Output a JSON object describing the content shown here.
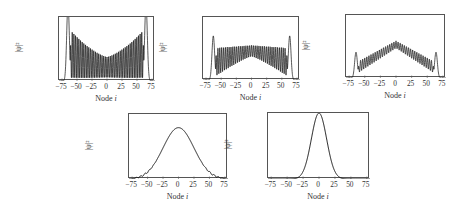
{
  "chart_data": [
    {
      "type": "line",
      "title": "",
      "xlabel": "Node i",
      "ylabel": "|ψ|²",
      "xlim": [
        -80,
        80
      ],
      "ylim": [
        0,
        0.02
      ],
      "x_ticks": [
        "−75",
        "−50",
        "−25",
        "0",
        "25",
        "50",
        "75"
      ],
      "y_ticks": [
        "0.02",
        "0.0175",
        "0.015",
        "0.0125",
        "0.01",
        "0.0075",
        "0.005",
        "0.0025"
      ],
      "grid": false,
      "frame": {
        "left": 58,
        "top": 16,
        "width": 96,
        "height": 64
      },
      "description": "Dense oscillations between ~0.001 and an envelope rising from ~0.0075 at center to ~0.015 near |i|=55; sharp edge peaks exceeding 0.02 at i≈±65; drops to 0 beyond |i|≈70",
      "series": [
        {
          "name": "|psi|^2",
          "profile": "edge-peaked",
          "center_env": 0.0075,
          "edge_env": 0.0155,
          "low": 0.001,
          "edge_peak": 0.024,
          "edge_pos": 65,
          "support": 70,
          "osc": 58
        }
      ]
    },
    {
      "type": "line",
      "title": "",
      "xlabel": "Node i",
      "ylabel": "|ψ|²",
      "xlim": [
        -80,
        80
      ],
      "ylim": [
        0,
        0.02
      ],
      "x_ticks": [
        "−75",
        "−50",
        "−25",
        "0",
        "25",
        "50",
        "75"
      ],
      "y_ticks": [
        "0.02",
        "0.0175",
        "0.015",
        "0.0125",
        "0.01",
        "0.0075",
        "0.005",
        "0.0025"
      ],
      "grid": false,
      "frame": {
        "left": 202,
        "top": 16,
        "width": 97,
        "height": 63
      },
      "description": "Oscillating band; upper envelope ~0.01-0.0115 across middle, lower envelope rising from ~0.002 at edges to ~0.008 at center; edge peaks ~0.014 at i≈±63",
      "series": [
        {
          "name": "|psi|^2",
          "profile": "flat-band",
          "center_env": 0.011,
          "edge_env": 0.0105,
          "low_center": 0.0075,
          "low_edge": 0.0015,
          "edge_peak": 0.014,
          "edge_pos": 63,
          "support": 70,
          "osc": 52
        }
      ]
    },
    {
      "type": "line",
      "title": "",
      "xlabel": "Node i",
      "ylabel": "|ψ|²",
      "xlim": [
        -80,
        80
      ],
      "ylim": [
        0,
        0.02
      ],
      "x_ticks": [
        "−75",
        "−50",
        "−25",
        "0",
        "25",
        "50",
        "75"
      ],
      "y_ticks": [
        "0.02",
        "0.0175",
        "0.015",
        "0.0125",
        "0.01",
        "0.0075",
        "0.005",
        "0.0025"
      ],
      "grid": false,
      "frame": {
        "left": 345,
        "top": 14,
        "width": 100,
        "height": 63
      },
      "description": "Triangular oscillating band peaking ~0.0115 at center, descending to ~0.005 near |i|=55; small edge peaks ~0.008 at i≈±65",
      "series": [
        {
          "name": "|psi|^2",
          "profile": "triangle-band",
          "center_env": 0.0118,
          "edge_env": 0.0055,
          "low_center": 0.0095,
          "low_edge": 0.002,
          "edge_peak": 0.0082,
          "edge_pos": 64,
          "support": 70,
          "osc": 48
        }
      ]
    },
    {
      "type": "line",
      "title": "",
      "xlabel": "Node i",
      "ylabel": "|ψ|²",
      "xlim": [
        -80,
        80
      ],
      "ylim": [
        0,
        0.02
      ],
      "x_ticks": [
        "−75",
        "−50",
        "−25",
        "0",
        "25",
        "50",
        "75"
      ],
      "y_ticks": [
        "0.02",
        "0.0175",
        "0.015",
        "0.0125",
        "0.01",
        "0.0075",
        "0.005",
        "0.0025"
      ],
      "grid": false,
      "frame": {
        "left": 128,
        "top": 113,
        "width": 99,
        "height": 65
      },
      "description": "Smooth bell-shaped curve with peak ~0.0158 at i=0, width sigma~25, small ripples in tails; ~0 beyond |i|≈70",
      "series": [
        {
          "name": "|psi|^2",
          "profile": "gaussian",
          "peak": 0.0158,
          "sigma": 25,
          "support": 70
        }
      ]
    },
    {
      "type": "line",
      "title": "",
      "xlabel": "Node i",
      "ylabel": "|ψ|²",
      "xlim": [
        -80,
        80
      ],
      "ylim": [
        0,
        0.031
      ],
      "x_ticks": [
        "−75",
        "−50",
        "−25",
        "0",
        "25",
        "50",
        "75"
      ],
      "y_ticks": [
        "0.03",
        "0.025",
        "0.02",
        "0.015",
        "0.01",
        "0.005",
        "0"
      ],
      "grid": false,
      "frame": {
        "left": 267,
        "top": 112,
        "width": 102,
        "height": 66
      },
      "description": "Narrow Gaussian peak ~0.031 at i=0 with sigma ~12, ~0 beyond |i|≈40",
      "series": [
        {
          "name": "|psi|^2",
          "profile": "gaussian",
          "peak": 0.031,
          "sigma": 12,
          "support": 80
        }
      ]
    }
  ],
  "labels": {
    "xlabel_prefix": "Node ",
    "xlabel_var": "i",
    "ylabel": "|ψ|²"
  }
}
